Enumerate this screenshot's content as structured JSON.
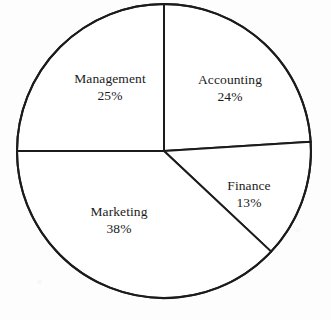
{
  "figure": {
    "background_color": "#fdfdfd",
    "stroke_color": "#1b1b1b",
    "text_color": "#1b1b1b"
  },
  "chart_data": {
    "type": "pie",
    "title": "",
    "subtitle": "",
    "xlabel": "",
    "ylabel": "",
    "legend_position": "none",
    "grid": false,
    "labels_inside_slices": true,
    "start_angle_deg": 0,
    "direction": "clockwise",
    "center": {
      "x": 164,
      "y": 151
    },
    "radius": 147,
    "categories": [
      "Accounting",
      "Finance",
      "Marketing",
      "Management"
    ],
    "values": [
      24,
      13,
      38,
      25
    ],
    "units": "percent",
    "total": 100,
    "slices": [
      {
        "name": "Accounting",
        "percent": 24,
        "percent_text": "24%",
        "start_angle_deg": 0,
        "end_angle_deg": 86.4,
        "label_x": 230,
        "label_y": 88,
        "fill": "#ffffff",
        "stroke": "#1b1b1b"
      },
      {
        "name": "Finance",
        "percent": 13,
        "percent_text": "13%",
        "start_angle_deg": 86.4,
        "end_angle_deg": 133.2,
        "label_x": 249,
        "label_y": 194,
        "fill": "#ffffff",
        "stroke": "#1b1b1b"
      },
      {
        "name": "Marketing",
        "percent": 38,
        "percent_text": "38%",
        "start_angle_deg": 133.2,
        "end_angle_deg": 270.0,
        "label_x": 119,
        "label_y": 220,
        "fill": "#ffffff",
        "stroke": "#1b1b1b"
      },
      {
        "name": "Management",
        "percent": 25,
        "percent_text": "25%",
        "start_angle_deg": 270.0,
        "end_angle_deg": 360.0,
        "label_x": 110,
        "label_y": 87,
        "fill": "#ffffff",
        "stroke": "#1b1b1b"
      }
    ]
  }
}
